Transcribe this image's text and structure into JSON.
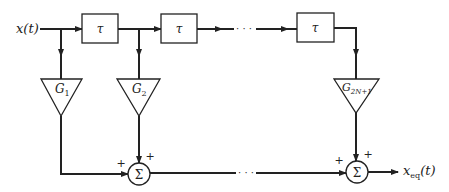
{
  "diagram": {
    "type": "transversal-filter-equalizer",
    "input_label": "x(t)",
    "output_label_base": "x",
    "output_label_sub": "eq",
    "output_label_tail": "(t)",
    "delays": [
      {
        "label": "τ"
      },
      {
        "label": "τ"
      },
      {
        "label": "τ"
      }
    ],
    "gains": [
      {
        "base": "G",
        "sub": "1"
      },
      {
        "base": "G",
        "sub": "2"
      },
      {
        "base": "G",
        "sub": "2N+1"
      }
    ],
    "summers": [
      {
        "symbol": "Σ",
        "sign_left": "+",
        "sign_top": "+"
      },
      {
        "symbol": "Σ",
        "sign_left": "+",
        "sign_top": "+"
      }
    ],
    "ellipsis": "· · ·",
    "colors": {
      "line": "#222222",
      "background": "#ffffff"
    }
  }
}
